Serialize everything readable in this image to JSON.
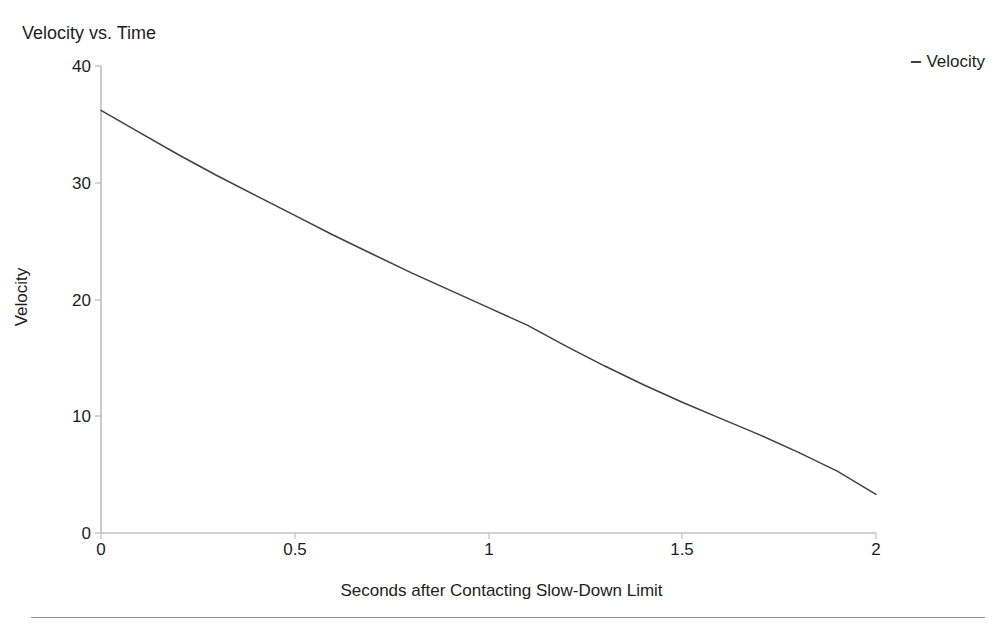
{
  "chart_data": {
    "type": "line",
    "title": "Velocity vs. Time",
    "xlabel": "Seconds after Contacting Slow-Down Limit",
    "ylabel": "Velocity",
    "xlim": [
      0,
      2
    ],
    "ylim": [
      0,
      40
    ],
    "xticks": [
      "0",
      "0.5",
      "1",
      "1.5",
      "2"
    ],
    "xtick_values": [
      0,
      0.5,
      1,
      1.5,
      2
    ],
    "yticks": [
      "0",
      "10",
      "20",
      "30",
      "40"
    ],
    "ytick_values": [
      0,
      10,
      20,
      30,
      40
    ],
    "grid": false,
    "legend_position": "top-right",
    "legend": [
      "Velocity"
    ],
    "series": [
      {
        "name": "Velocity",
        "color": "#404040",
        "x": [
          0,
          0.1,
          0.2,
          0.3,
          0.4,
          0.5,
          0.6,
          0.7,
          0.8,
          0.9,
          1.0,
          1.1,
          1.2,
          1.3,
          1.4,
          1.5,
          1.6,
          1.7,
          1.8,
          1.9,
          2.0
        ],
        "values": [
          36.2,
          34.3,
          32.4,
          30.6,
          28.9,
          27.2,
          25.5,
          23.9,
          22.3,
          20.8,
          19.3,
          17.8,
          16.0,
          14.3,
          12.7,
          11.2,
          9.8,
          8.4,
          6.9,
          5.3,
          3.3
        ]
      }
    ]
  },
  "chart": {
    "title": "Velocity vs. Time",
    "legend_marker": "-",
    "legend_label": "Velocity",
    "xlabel": "Seconds after Contacting Slow-Down Limit",
    "ylabel": "Velocity",
    "axis_color": "#b4b4b4",
    "line_color": "#404040",
    "rule_color": "#8e8e8e"
  }
}
